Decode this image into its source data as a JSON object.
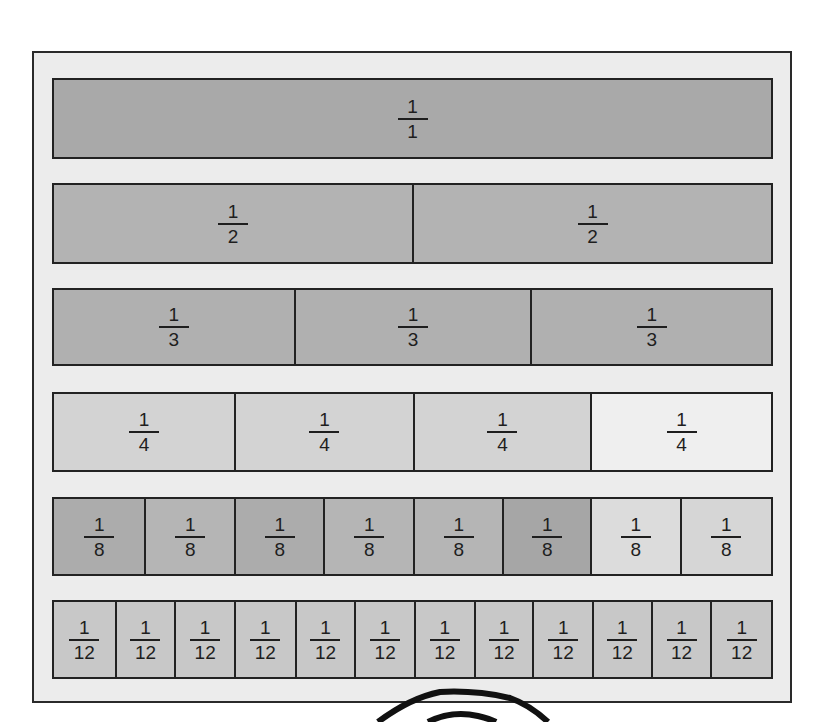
{
  "colors": {
    "frame_bg": "#ececec",
    "border": "#222222",
    "dark": "#a6a6a6",
    "medium": "#b9b9b9",
    "light": "#d4d4d4",
    "lighter": "#eeeeee"
  },
  "rows": [
    {
      "name": "wholes",
      "denominator": 1,
      "cells": [
        {
          "num": "1",
          "den": "1",
          "shade": "#a9a9a9",
          "width": 721
        }
      ]
    },
    {
      "name": "halves",
      "denominator": 2,
      "cells": [
        {
          "num": "1",
          "den": "2",
          "shade": "#b3b3b3",
          "width": 362
        },
        {
          "num": "1",
          "den": "2",
          "shade": "#b3b3b3",
          "width": 359
        }
      ]
    },
    {
      "name": "thirds",
      "denominator": 3,
      "cells": [
        {
          "num": "1",
          "den": "3",
          "shade": "#b0b0b0",
          "width": 243
        },
        {
          "num": "1",
          "den": "3",
          "shade": "#b0b0b0",
          "width": 238
        },
        {
          "num": "1",
          "den": "3",
          "shade": "#b0b0b0",
          "width": 240
        }
      ]
    },
    {
      "name": "fourths",
      "denominator": 4,
      "cells": [
        {
          "num": "1",
          "den": "4",
          "shade": "#d3d3d3",
          "width": 183
        },
        {
          "num": "1",
          "den": "4",
          "shade": "#d3d3d3",
          "width": 180
        },
        {
          "num": "1",
          "den": "4",
          "shade": "#d3d3d3",
          "width": 178
        },
        {
          "num": "1",
          "den": "4",
          "shade": "#efefef",
          "width": 180
        }
      ]
    },
    {
      "name": "eighths",
      "denominator": 8,
      "cells": [
        {
          "num": "1",
          "den": "8",
          "shade": "#acacac",
          "width": 93
        },
        {
          "num": "1",
          "den": "8",
          "shade": "#b5b5b5",
          "width": 90
        },
        {
          "num": "1",
          "den": "8",
          "shade": "#acacac",
          "width": 90
        },
        {
          "num": "1",
          "den": "8",
          "shade": "#b5b5b5",
          "width": 90
        },
        {
          "num": "1",
          "den": "8",
          "shade": "#b5b5b5",
          "width": 90
        },
        {
          "num": "1",
          "den": "8",
          "shade": "#a6a6a6",
          "width": 88
        },
        {
          "num": "1",
          "den": "8",
          "shade": "#dcdcdc",
          "width": 90
        },
        {
          "num": "1",
          "den": "8",
          "shade": "#d6d6d6",
          "width": 90
        }
      ]
    },
    {
      "name": "twelfths",
      "denominator": 12,
      "cells": [
        {
          "num": "1",
          "den": "12",
          "shade": "#c8c8c8",
          "width": 63
        },
        {
          "num": "1",
          "den": "12",
          "shade": "#c8c8c8",
          "width": 60
        },
        {
          "num": "1",
          "den": "12",
          "shade": "#c8c8c8",
          "width": 60
        },
        {
          "num": "1",
          "den": "12",
          "shade": "#c8c8c8",
          "width": 61
        },
        {
          "num": "1",
          "den": "12",
          "shade": "#c8c8c8",
          "width": 60
        },
        {
          "num": "1",
          "den": "12",
          "shade": "#c8c8c8",
          "width": 60
        },
        {
          "num": "1",
          "den": "12",
          "shade": "#c8c8c8",
          "width": 60
        },
        {
          "num": "1",
          "den": "12",
          "shade": "#c8c8c8",
          "width": 59
        },
        {
          "num": "1",
          "den": "12",
          "shade": "#c8c8c8",
          "width": 60
        },
        {
          "num": "1",
          "den": "12",
          "shade": "#c8c8c8",
          "width": 59
        },
        {
          "num": "1",
          "den": "12",
          "shade": "#c8c8c8",
          "width": 60
        },
        {
          "num": "1",
          "den": "12",
          "shade": "#c8c8c8",
          "width": 59
        }
      ]
    }
  ],
  "row_positions": [
    {
      "top": 78,
      "height": 81
    },
    {
      "top": 183,
      "height": 81
    },
    {
      "top": 288,
      "height": 78
    },
    {
      "top": 392,
      "height": 80
    },
    {
      "top": 497,
      "height": 79
    },
    {
      "top": 600,
      "height": 79
    }
  ]
}
